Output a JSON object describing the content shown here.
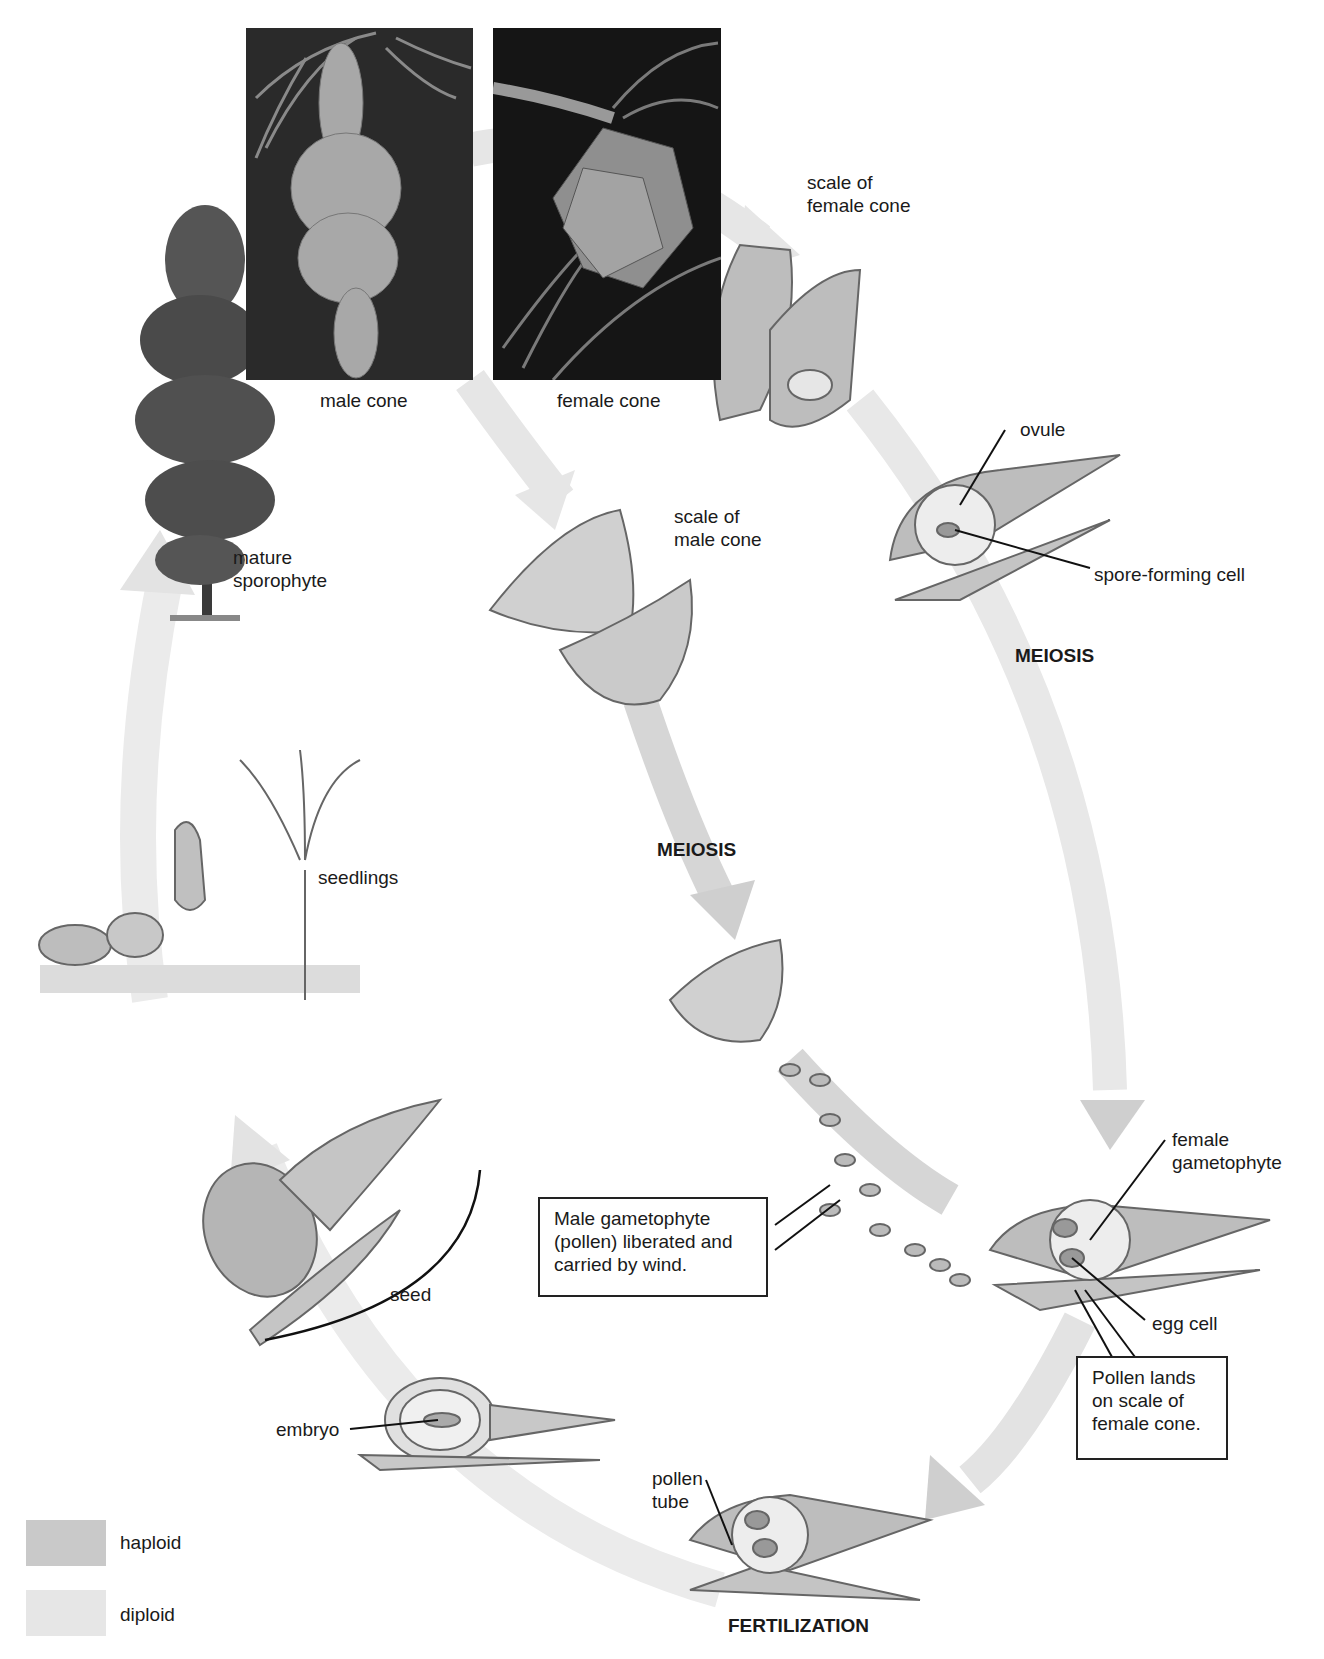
{
  "colors": {
    "haploid": "#c9c9c9",
    "diploid": "#e6e6e6",
    "arrow_haploid": "#cfcfcf",
    "arrow_diploid": "#e8e8e8"
  },
  "photos": {
    "male_cone": {
      "label": "male cone"
    },
    "female_cone": {
      "label": "female cone"
    }
  },
  "labels": {
    "mature_sporophyte": "mature\nsporophyte",
    "scale_female_cone": "scale of\nfemale cone",
    "ovule": "ovule",
    "spore_forming_cell": "spore-forming cell",
    "meiosis_female": "MEIOSIS",
    "scale_male_cone": "scale of\nmale cone",
    "meiosis_male": "MEIOSIS",
    "seedlings": "seedlings",
    "seed": "seed",
    "female_gametophyte": "female\ngametophyte",
    "egg_cell": "egg cell",
    "embryo": "embryo",
    "pollen_tube": "pollen\ntube",
    "fertilization": "FERTILIZATION"
  },
  "callouts": {
    "pollen_liberated": "Male gametophyte\n(pollen) liberated and\ncarried by wind.",
    "pollen_lands": "Pollen lands\non scale of\nfemale cone."
  },
  "legend": [
    {
      "label": "haploid",
      "color": "#c9c9c9"
    },
    {
      "label": "diploid",
      "color": "#e6e6e6"
    }
  ]
}
